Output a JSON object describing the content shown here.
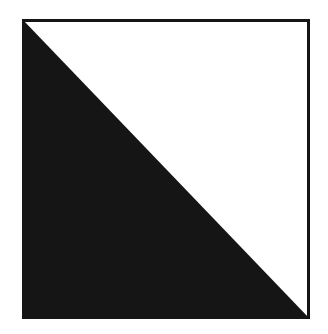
{
  "diagram": {
    "shape": "square-split-by-diagonal",
    "colors": {
      "background": "#ffffff",
      "filled_triangle": "#151515",
      "empty_triangle": "#ffffff",
      "border": "#151515"
    },
    "regions": [
      {
        "name": "lower-left-triangle",
        "fill": "black"
      },
      {
        "name": "upper-right-triangle",
        "fill": "white"
      }
    ]
  }
}
